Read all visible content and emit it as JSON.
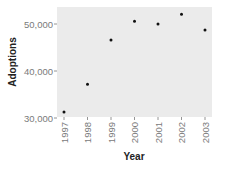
{
  "chart_data": {
    "type": "scatter",
    "title": "",
    "xlabel": "Year",
    "ylabel": "Adoptions",
    "categories": [
      "1997",
      "1998",
      "1999",
      "2000",
      "2001",
      "2002",
      "2003"
    ],
    "x": [
      "1997",
      "1998",
      "1999",
      "2000",
      "2001",
      "2002",
      "2003"
    ],
    "values": [
      31300,
      37200,
      46600,
      50600,
      50000,
      52100,
      48700
    ],
    "ylim": [
      30000,
      53500
    ],
    "yticks": [
      30000,
      40000,
      50000
    ],
    "ytick_labels": [
      "30,000",
      "40,000",
      "50,000"
    ],
    "xtick_rotation": -90,
    "grid": false,
    "legend": null
  },
  "colors": {
    "panel_background": "#ebebeb",
    "point": "#111111",
    "tick": "#7a7a7a",
    "axis_title": "#222222"
  }
}
